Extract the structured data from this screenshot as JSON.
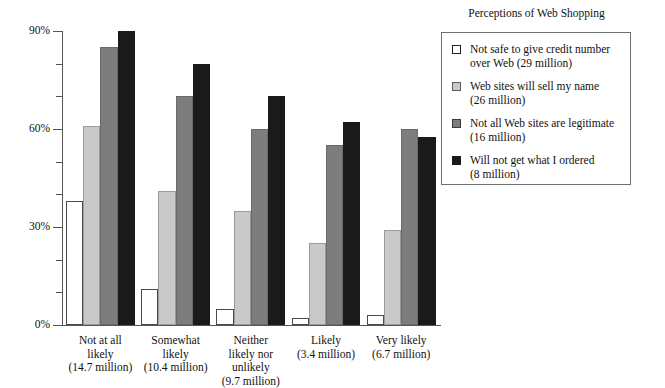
{
  "chart_data": {
    "type": "bar",
    "title": "",
    "xlabel": "",
    "ylabel": "",
    "ylim": [
      0,
      90
    ],
    "ytick_values": [
      0,
      30,
      60,
      90
    ],
    "ytick_labels": [
      "0%",
      "30%",
      "60%",
      "90%"
    ],
    "yminor_step": 10,
    "grid": false,
    "legend_position": "right",
    "legend_title": "Perceptions of Web Shopping",
    "categories": [
      "Not at all\nlikely\n(14.7 million)",
      "Somewhat\nlikely\n(10.4 million)",
      "Neither\nlikely nor\nunlikely\n(9.7 million)",
      "Likely\n(3.4 million)",
      "Very likely\n(6.7 million)"
    ],
    "category_labels": [
      [
        "Not at all",
        "likely",
        "(14.7 million)"
      ],
      [
        "Somewhat",
        "likely",
        "(10.4 million)"
      ],
      [
        "Neither",
        "likely nor",
        "unlikely",
        "(9.7 million)"
      ],
      [
        "Likely",
        "(3.4 million)"
      ],
      [
        "Very likely",
        "(6.7 million)"
      ]
    ],
    "series": [
      {
        "name": "Not safe to give credit number over Web (29 million)",
        "color": "#ffffff",
        "values": [
          38,
          11,
          5,
          2,
          3
        ]
      },
      {
        "name": "Web sites will sell my name (26 million)",
        "color": "#c9c9c9",
        "values": [
          61,
          41,
          35,
          25,
          29
        ]
      },
      {
        "name": "Not all Web sites are legitimate (16 million)",
        "color": "#7d7d7d",
        "values": [
          85,
          70,
          60,
          55,
          60
        ]
      },
      {
        "name": "Will not get what I ordered (8 million)",
        "color": "#1a1a1a",
        "values": [
          90,
          80,
          70,
          62,
          57.5
        ]
      }
    ]
  },
  "legend": {
    "title": "Perceptions of Web Shopping",
    "items": [
      {
        "lines": [
          "Not safe to give credit number",
          "over Web (29 million)"
        ],
        "color": "#ffffff"
      },
      {
        "lines": [
          "Web sites will sell my name",
          "(26 million)"
        ],
        "color": "#c9c9c9"
      },
      {
        "lines": [
          "Not all Web sites are legitimate",
          "(16 million)"
        ],
        "color": "#7d7d7d"
      },
      {
        "lines": [
          "Will not get what I ordered",
          "(8 million)"
        ],
        "color": "#1a1a1a"
      }
    ]
  }
}
